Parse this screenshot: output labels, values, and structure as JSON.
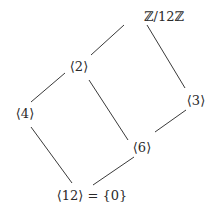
{
  "diagram": {
    "nodes": {
      "top": "ℤ/12ℤ",
      "n2": "⟨2⟩",
      "n3": "⟨3⟩",
      "n4": "⟨4⟩",
      "n6": "⟨6⟩",
      "bottom": "⟨12⟩ = {0}"
    },
    "edges": [
      [
        "ℤ/12ℤ",
        "⟨2⟩"
      ],
      [
        "ℤ/12ℤ",
        "⟨3⟩"
      ],
      [
        "⟨2⟩",
        "⟨4⟩"
      ],
      [
        "⟨2⟩",
        "⟨6⟩"
      ],
      [
        "⟨3⟩",
        "⟨6⟩"
      ],
      [
        "⟨4⟩",
        "⟨12⟩ = {0}"
      ],
      [
        "⟨6⟩",
        "⟨12⟩ = {0}"
      ]
    ],
    "colors": {
      "line": "#3a3a3a",
      "text": "#2a2a2a"
    }
  }
}
